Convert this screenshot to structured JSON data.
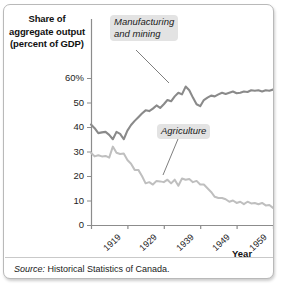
{
  "figure": {
    "y_axis_title_lines": [
      "Share of",
      "aggregate output",
      "(percent of GDP)"
    ],
    "x_axis_label": "Year",
    "source_prefix": "Source:",
    "source_text": "Historical Statistics of Canada.",
    "frame_color": "#b9b9b9",
    "callout_bg": "#e3e3e3"
  },
  "chart_data": {
    "type": "line",
    "title": "",
    "xlabel": "Year",
    "ylabel": "Share of aggregate output (percent of GDP)",
    "xlim": [
      1919,
      1969
    ],
    "ylim": [
      0,
      65
    ],
    "yticks": [
      0,
      10,
      20,
      30,
      40,
      50,
      60
    ],
    "ytick_labels": [
      "0",
      "10",
      "20",
      "30",
      "40",
      "50",
      "60%"
    ],
    "xticks": [
      1919,
      1929,
      1939,
      1949,
      1959,
      1969
    ],
    "xtick_labels": [
      "1919",
      "1929",
      "1939",
      "1949",
      "1959",
      "1969"
    ],
    "grid": false,
    "legend": "callout-annotations",
    "series": [
      {
        "name": "Manufacturing and mining",
        "color": "#8a8a8a",
        "label_position": "top-left-callout",
        "x": [
          1919,
          1920,
          1921,
          1922,
          1923,
          1924,
          1925,
          1926,
          1927,
          1928,
          1929,
          1930,
          1931,
          1932,
          1933,
          1934,
          1935,
          1936,
          1937,
          1938,
          1939,
          1940,
          1941,
          1942,
          1943,
          1944,
          1945,
          1946,
          1947,
          1948,
          1949,
          1950,
          1951,
          1952,
          1953,
          1954,
          1955,
          1956,
          1957,
          1958,
          1959,
          1960,
          1961,
          1962,
          1963,
          1964,
          1965,
          1966,
          1967,
          1968,
          1969
        ],
        "values": [
          41.0,
          39.5,
          37.5,
          37.8,
          38.0,
          36.8,
          35.0,
          38.0,
          37.2,
          35.0,
          38.5,
          40.8,
          42.5,
          44.0,
          45.5,
          46.8,
          46.5,
          47.5,
          48.8,
          47.8,
          49.3,
          51.0,
          50.5,
          52.5,
          54.0,
          53.3,
          56.5,
          55.0,
          52.0,
          49.3,
          48.5,
          51.0,
          52.0,
          52.8,
          52.5,
          53.3,
          54.0,
          53.5,
          54.0,
          54.5,
          53.8,
          54.0,
          54.5,
          54.3,
          55.0,
          54.8,
          55.0,
          54.5,
          55.0,
          54.8,
          55.3
        ]
      },
      {
        "name": "Agriculture",
        "color": "#bfbfbf",
        "label_position": "middle-right-callout",
        "x": [
          1919,
          1920,
          1921,
          1922,
          1923,
          1924,
          1925,
          1926,
          1927,
          1928,
          1929,
          1930,
          1931,
          1932,
          1933,
          1934,
          1935,
          1936,
          1937,
          1938,
          1939,
          1940,
          1941,
          1942,
          1943,
          1944,
          1945,
          1946,
          1947,
          1948,
          1949,
          1950,
          1951,
          1952,
          1953,
          1954,
          1955,
          1956,
          1957,
          1958,
          1959,
          1960,
          1961,
          1962,
          1963,
          1964,
          1965,
          1966,
          1967,
          1968,
          1969
        ],
        "values": [
          29.5,
          28.0,
          28.5,
          28.0,
          28.2,
          27.5,
          32.0,
          29.5,
          29.0,
          29.2,
          26.5,
          25.0,
          22.5,
          22.5,
          20.0,
          17.0,
          17.5,
          16.5,
          18.0,
          17.8,
          17.5,
          18.5,
          17.0,
          18.5,
          16.0,
          19.0,
          18.5,
          18.8,
          17.5,
          18.0,
          16.5,
          16.5,
          15.0,
          13.5,
          11.5,
          11.0,
          11.0,
          10.5,
          9.5,
          10.0,
          9.0,
          9.5,
          8.5,
          9.5,
          8.8,
          9.0,
          8.5,
          9.0,
          8.0,
          8.2,
          7.0
        ]
      }
    ],
    "annotations": [
      {
        "text": "Manufacturing and mining",
        "points_to_year": 1942
      },
      {
        "text": "Agriculture",
        "points_to_year": 1945
      }
    ]
  }
}
